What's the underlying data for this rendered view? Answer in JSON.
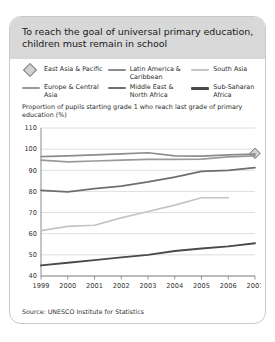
{
  "header": {
    "title": "To reach the goal of universal primary education, children must remain in school"
  },
  "legend": {
    "items": [
      {
        "label": "East Asia & Pacific",
        "marker": "diamond-marker-icon",
        "color": "#8c8c8c"
      },
      {
        "label": "Latin America & Caribbean",
        "marker": "line-swatch-icon",
        "color": "#8c8c8c"
      },
      {
        "label": "South Asia",
        "marker": "line-swatch-icon",
        "color": "#c4c4c4"
      },
      {
        "label": "Europe & Central Asia",
        "marker": "line-swatch-icon",
        "color": "#9a9a9a"
      },
      {
        "label": "Middle East & North Africa",
        "marker": "line-swatch-icon",
        "color": "#6e6e6e"
      },
      {
        "label": "Sub-Saharan Africa",
        "marker": "line-swatch-icon",
        "color": "#4a4a4a"
      }
    ]
  },
  "axis_caption": "Proportion of pupils starting grade 1 who reach last grade of primary education (%)",
  "source": "Source: UNESCO Institute for Statistics",
  "chart_data": {
    "type": "line",
    "title": "To reach the goal of universal primary education, children must remain in school",
    "xlabel": "",
    "ylabel": "Proportion of pupils starting grade 1 who reach last grade of primary education (%)",
    "x": [
      1999,
      2000,
      2001,
      2002,
      2003,
      2004,
      2005,
      2006,
      2007
    ],
    "xlim": [
      1999,
      2007
    ],
    "ylim": [
      40,
      110
    ],
    "yticks": [
      40,
      50,
      60,
      70,
      80,
      90,
      100,
      110
    ],
    "xticks": [
      "1999",
      "2000",
      "2001",
      "2002",
      "2003",
      "2004",
      "2005",
      "2006",
      "2007"
    ],
    "grid": true,
    "legend_position": "top",
    "series": [
      {
        "name": "East Asia & Pacific",
        "color": "#8c8c8c",
        "marker": "diamond",
        "values": [
          null,
          null,
          null,
          null,
          null,
          null,
          null,
          null,
          98
        ]
      },
      {
        "name": "Latin America & Caribbean",
        "color": "#8c8c8c",
        "values": [
          96.5,
          96.8,
          97.3,
          97.8,
          98.3,
          96.8,
          96.7,
          97.3,
          97.6
        ]
      },
      {
        "name": "South Asia",
        "color": "#c4c4c4",
        "values": [
          61.5,
          63.5,
          64.0,
          67.5,
          70.5,
          73.5,
          77.0,
          77.0,
          null
        ]
      },
      {
        "name": "Europe & Central Asia",
        "color": "#9a9a9a",
        "values": [
          94.8,
          94.0,
          94.4,
          94.8,
          95.2,
          95.2,
          95.3,
          96.3,
          96.8
        ]
      },
      {
        "name": "Middle East & North Africa",
        "color": "#6e6e6e",
        "values": [
          80.5,
          79.8,
          81.3,
          82.5,
          84.5,
          86.8,
          89.5,
          90.0,
          91.3
        ]
      },
      {
        "name": "Sub-Saharan Africa",
        "color": "#4a4a4a",
        "values": [
          45.0,
          46.3,
          47.5,
          48.8,
          50.0,
          51.8,
          53.0,
          54.0,
          55.5
        ]
      }
    ]
  }
}
